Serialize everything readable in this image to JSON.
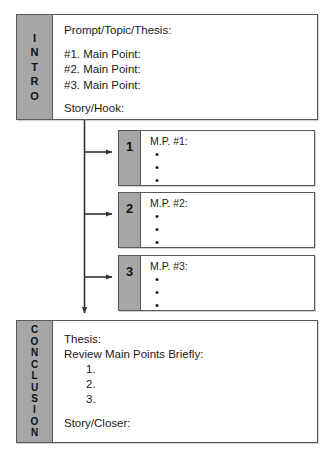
{
  "diagram": {
    "colors": {
      "tab_gray": "#a6a6a6",
      "border": "#585858",
      "body_white": "#ffffff",
      "text": "#111111",
      "connector": "#333333"
    },
    "intro": {
      "tab_label": "I\nN\nT\nR\nO",
      "lines": [
        "Prompt/Topic/Thesis:",
        "#1. Main Point:",
        "#2. Main Point:",
        "#3. Main Point:",
        "Story/Hook:"
      ]
    },
    "main_points": [
      {
        "number": "1",
        "title": "M.P. #1:",
        "bullets": [
          "",
          "",
          ""
        ]
      },
      {
        "number": "2",
        "title": "M.P. #2:",
        "bullets": [
          "",
          "",
          ""
        ]
      },
      {
        "number": "3",
        "title": "M.P. #3:",
        "bullets": [
          "",
          "",
          ""
        ]
      }
    ],
    "conclusion": {
      "tab_label": "C\nO\nN\nC\nL\nU\nS\nI\nO\nN",
      "lines": [
        "Thesis:",
        "Review Main Points Briefly:",
        "1.",
        "2.",
        "3.",
        "Story/Closer:"
      ]
    }
  }
}
